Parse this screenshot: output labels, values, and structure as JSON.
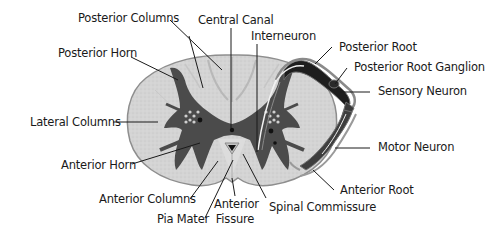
{
  "colors": {
    "white_matter": "#d6d6d6",
    "white_matter_light": "#e4e4e4",
    "gray_matter": "#4a4a4a",
    "outline": "#9a9a9a",
    "root_dark": "#1c1c1c",
    "leader_line": "#1a1a1a"
  },
  "labels": {
    "posterior_columns": "Posterior Columns",
    "central_canal": "Central Canal",
    "posterior_horn": "Posterior Horn",
    "interneuron": "Interneuron",
    "posterior_root": "Posterior Root",
    "posterior_root_ganglion": "Posterior Root Ganglion",
    "sensory_neuron": "Sensory Neuron",
    "lateral_columns": "Lateral Columns",
    "motor_neuron": "Motor Neuron",
    "anterior_horn": "Anterior Horn",
    "anterior_root": "Anterior Root",
    "anterior_columns": "Anterior Columns",
    "spinal_commissure": "Spinal Commissure",
    "pia_mater": "Pia Mater",
    "anterior_fissure_line1": "Anterior",
    "anterior_fissure_line2": "Fissure"
  }
}
